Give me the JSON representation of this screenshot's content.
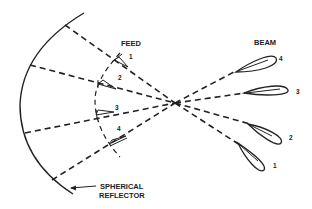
{
  "diagram": {
    "labels": {
      "feed": "FEED",
      "beam": "BEAM",
      "reflector_line1": "SPHERICAL",
      "reflector_line2": "REFLECTOR"
    },
    "feeds": [
      {
        "id": "1",
        "label": "1"
      },
      {
        "id": "2",
        "label": "2"
      },
      {
        "id": "3",
        "label": "3"
      },
      {
        "id": "4",
        "label": "4"
      }
    ],
    "beams": [
      {
        "id": "1",
        "label": "1"
      },
      {
        "id": "2",
        "label": "2"
      },
      {
        "id": "3",
        "label": "3"
      },
      {
        "id": "4",
        "label": "4"
      }
    ],
    "colors": {
      "stroke": "#222222",
      "background": "#ffffff"
    }
  }
}
